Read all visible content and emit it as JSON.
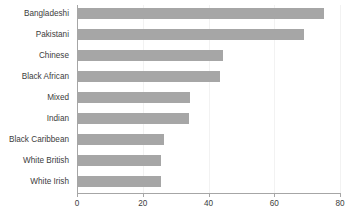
{
  "chart_data": {
    "type": "bar",
    "orientation": "horizontal",
    "title": "",
    "subtitle": "",
    "xlabel": "",
    "ylabel": "",
    "categories": [
      "Bangladeshi",
      "Pakistani",
      "Chinese",
      "Black African",
      "Mixed",
      "Indian",
      "Black Caribbean",
      "White British",
      "White Irish"
    ],
    "values": [
      75,
      69,
      44.5,
      43.5,
      34.5,
      34,
      26.5,
      25.5,
      25.5
    ],
    "xlim": [
      0,
      80
    ],
    "xticks": [
      0,
      20,
      40,
      60,
      80
    ],
    "xtick_labels": [
      "0",
      "20",
      "40",
      "60",
      "80"
    ],
    "grid": true,
    "grid_axis": "x",
    "legend": false,
    "legend_position": "none",
    "series": [
      {
        "name": "",
        "values": [
          75,
          69,
          44.5,
          43.5,
          34.5,
          34,
          26.5,
          25.5,
          25.5
        ]
      }
    ]
  },
  "colors": {
    "bar_fill": "#a6a6a6",
    "axis_line": "#a6a6a6",
    "gridline": "#f2f2f2",
    "label_text": "#3d3d3d",
    "background": "#ffffff"
  }
}
